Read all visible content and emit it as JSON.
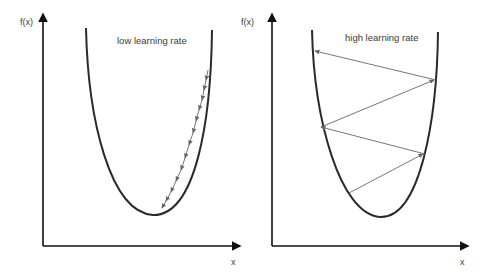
{
  "panels": [
    {
      "id": "left",
      "title": "low learning rate",
      "y_axis_label": "f(x)",
      "x_axis_label": "x",
      "description": "Many small gradient descent steps along the right side of the parabola converging to the minimum"
    },
    {
      "id": "right",
      "title": "high learning rate",
      "y_axis_label": "f(x)",
      "x_axis_label": "x",
      "description": "Large gradient descent steps oscillating across the parabola and diverging upward"
    }
  ],
  "colors": {
    "axis": "#111111",
    "curve": "#2a2a2a",
    "arrow": "#666666",
    "text": "#404040"
  }
}
